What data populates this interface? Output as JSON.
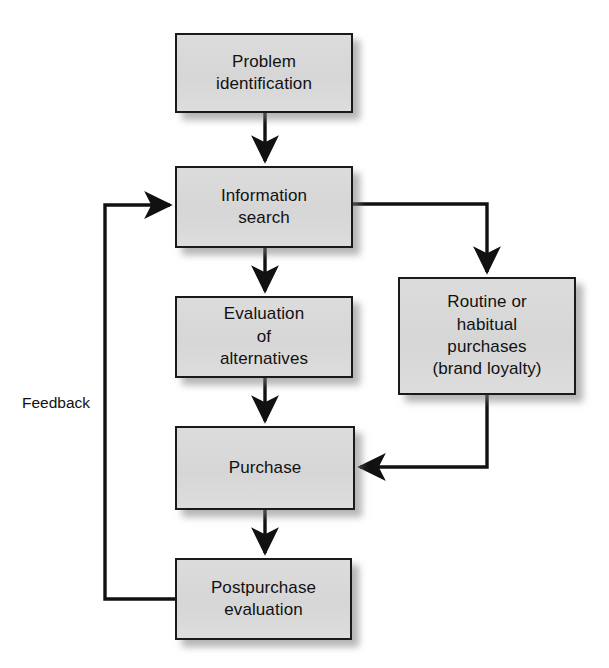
{
  "diagram": {
    "background_color": "#ffffff",
    "node_fill": "#d9d9d9",
    "node_border": "#1a1a1a",
    "line_color": "#111111",
    "nodes": [
      {
        "id": "problem",
        "label": "Problem\nidentification",
        "x": 175,
        "y": 33,
        "w": 178,
        "h": 80
      },
      {
        "id": "information",
        "label": "Information\nsearch",
        "x": 175,
        "y": 166,
        "w": 178,
        "h": 82
      },
      {
        "id": "evaluation",
        "label": "Evaluation\nof\nalternatives",
        "x": 175,
        "y": 296,
        "w": 178,
        "h": 82
      },
      {
        "id": "routine",
        "label": "Routine or\nhabitual\npurchases\n(brand loyalty)",
        "x": 398,
        "y": 277,
        "w": 178,
        "h": 118
      },
      {
        "id": "purchase",
        "label": "Purchase",
        "x": 175,
        "y": 426,
        "w": 180,
        "h": 84
      },
      {
        "id": "postpurchase",
        "label": "Postpurchase\nevaluation",
        "x": 175,
        "y": 558,
        "w": 177,
        "h": 82
      }
    ],
    "captions": [
      {
        "id": "feedback",
        "label": "Feedback",
        "x": 22,
        "y": 394
      }
    ],
    "edges": [
      {
        "id": "problem-to-information",
        "from": "problem",
        "to": "information",
        "type": "straight-down"
      },
      {
        "id": "information-to-evaluation",
        "from": "information",
        "to": "evaluation",
        "type": "straight-down"
      },
      {
        "id": "evaluation-to-purchase",
        "from": "evaluation",
        "to": "purchase",
        "type": "straight-down"
      },
      {
        "id": "purchase-to-postpurchase",
        "from": "purchase",
        "to": "postpurchase",
        "type": "straight-down"
      },
      {
        "id": "information-to-routine",
        "from": "information",
        "to": "routine",
        "type": "right-then-down"
      },
      {
        "id": "routine-to-purchase",
        "from": "routine",
        "to": "purchase",
        "type": "down-then-left"
      },
      {
        "id": "postpurchase-to-information",
        "from": "postpurchase",
        "to": "information",
        "type": "feedback-loop"
      }
    ]
  }
}
